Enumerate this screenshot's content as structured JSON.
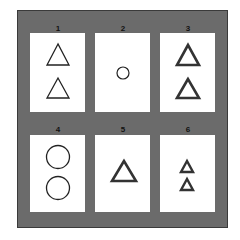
{
  "figure": {
    "background_color": "#6b6b6b",
    "panel_color": "#ffffff",
    "stroke_color": "#222222",
    "panels": [
      {
        "label": "1",
        "shapes": "2 triangles (thin outline)"
      },
      {
        "label": "2",
        "shapes": "1 small circle"
      },
      {
        "label": "3",
        "shapes": "2 triangles (bold outline)"
      },
      {
        "label": "4",
        "shapes": "2 large circles"
      },
      {
        "label": "5",
        "shapes": "1 triangle (bold outline)"
      },
      {
        "label": "6",
        "shapes": "2 small triangles (bold outline)"
      }
    ]
  }
}
